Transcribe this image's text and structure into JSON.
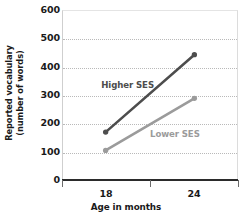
{
  "chart_data": {
    "type": "line",
    "title": "",
    "xlabel": "Age in months",
    "ylabel_line1": "Reported vocabulary",
    "ylabel_line2": "(number of words)",
    "x": [
      18,
      24
    ],
    "xtick_labels": [
      "18",
      "24"
    ],
    "ytick_labels": [
      "0",
      "100",
      "200",
      "300",
      "400",
      "500",
      "600"
    ],
    "ylim": [
      0,
      600
    ],
    "ytick_values": [
      0,
      100,
      200,
      300,
      400,
      500,
      600
    ],
    "gridline_values": [
      100,
      200,
      300,
      400,
      500
    ],
    "grid": "horizontal-dotted",
    "legend_position": "inline-labels",
    "series": [
      {
        "name": "Higher SES",
        "values": [
          170,
          445
        ],
        "color": "#4d4d4d",
        "label_x_pct": 22,
        "label_y_pct": 41
      },
      {
        "name": "Lower SES",
        "values": [
          105,
          290
        ],
        "color": "#9b9b9b",
        "label_x_pct": 50,
        "label_y_pct": 70
      }
    ]
  },
  "axis_colors": {
    "axis_line": "#2b2b2b",
    "grid": "#b9b9b9",
    "tick": "#6b6b6b",
    "text": "#1a1a1a"
  }
}
